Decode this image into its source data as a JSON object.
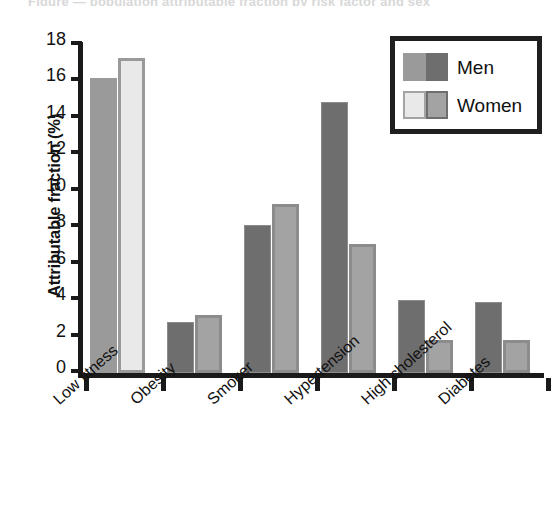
{
  "figure": {
    "top_clipped_caption": "Figure — population attributable fraction by risk factor and sex",
    "background": "#ffffff"
  },
  "chart_data": {
    "type": "bar",
    "title": "",
    "xlabel": "",
    "ylabel": "Attributable fraction (%)",
    "categories": [
      "Low fitness",
      "Obesity",
      "Smoker",
      "Hypertension",
      "High cholesterol",
      "Diabetes"
    ],
    "series": [
      {
        "name": "Men",
        "values": [
          16.2,
          2.8,
          8.1,
          14.9,
          4.0,
          3.9
        ]
      },
      {
        "name": "Women",
        "values": [
          17.3,
          3.2,
          9.3,
          7.1,
          1.8,
          1.8
        ]
      }
    ],
    "ylim": [
      0,
      18
    ],
    "yticks": [
      0,
      2,
      4,
      6,
      8,
      10,
      12,
      14,
      16,
      18
    ],
    "ytick_labels": [
      "0",
      "2",
      "4",
      "6",
      "8",
      "10",
      "12",
      "14",
      "16",
      "18"
    ],
    "grid": false,
    "legend_position": "top-right",
    "xtick_label_rotation": -42,
    "bar_colors": {
      "low_fitness_men": "#9a9a9a",
      "low_fitness_women": "#e9e9e9",
      "men": "#6e6e6e",
      "women": "#a3a3a3",
      "bar_edge": "#8c8c8c",
      "axis": "#1a1a1a"
    }
  },
  "legend": {
    "entries": [
      {
        "label": "Men",
        "swatch_left": "#9a9a9a",
        "swatch_right": "#6e6e6e"
      },
      {
        "label": "Women",
        "swatch_left": "#e9e9e9",
        "swatch_right": "#a3a3a3"
      }
    ]
  }
}
